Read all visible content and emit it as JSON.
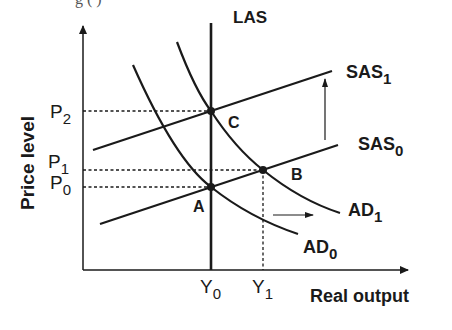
{
  "caption_partial": "g          (          )",
  "axes": {
    "y_label": "Price level",
    "x_label": "Real output"
  },
  "curves": {
    "las": {
      "label": "LAS"
    },
    "sas0": {
      "label": "SAS",
      "sub": "0"
    },
    "sas1": {
      "label": "SAS",
      "sub": "1"
    },
    "ad0": {
      "label": "AD",
      "sub": "0"
    },
    "ad1": {
      "label": "AD",
      "sub": "1"
    }
  },
  "points": {
    "a": {
      "label": "A"
    },
    "b": {
      "label": "B"
    },
    "c": {
      "label": "C"
    }
  },
  "y_ticks": [
    {
      "label": "P",
      "sub": "2"
    },
    {
      "label": "P",
      "sub": "1"
    },
    {
      "label": "P",
      "sub": "0"
    }
  ],
  "x_ticks": [
    {
      "label": "Y",
      "sub": "0"
    },
    {
      "label": "Y",
      "sub": "1"
    }
  ],
  "colors": {
    "ink": "#1a1a1a",
    "background": "#ffffff"
  }
}
